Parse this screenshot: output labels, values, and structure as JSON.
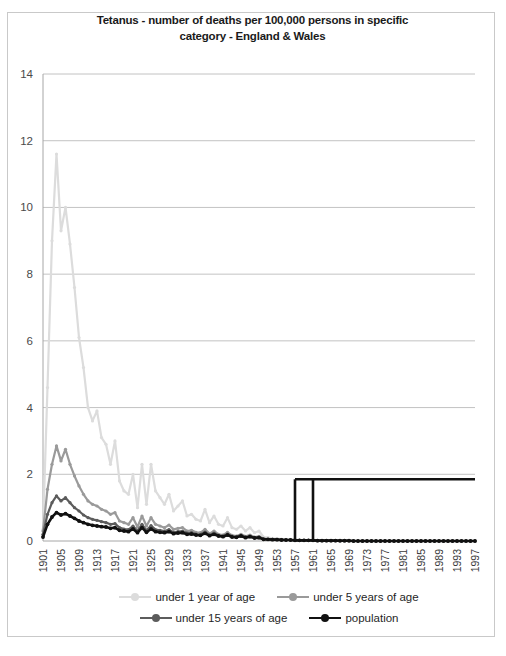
{
  "chart_data": {
    "type": "line",
    "title": "Tetanus - number of deaths per 100,000  persons in specific category - England & Wales",
    "title_line1": "Tetanus - number of deaths per 100,000  persons in specific",
    "title_line2": "category - England & Wales",
    "xlabel": "",
    "ylabel": "",
    "ylim": [
      0,
      14
    ],
    "yticks": [
      0,
      2,
      4,
      6,
      8,
      10,
      12,
      14
    ],
    "grid": true,
    "legend_position": "bottom",
    "x_start": 1901,
    "x_end": 1997,
    "xtick_step": 4,
    "xticks": [
      1901,
      1905,
      1909,
      1913,
      1917,
      1921,
      1925,
      1929,
      1933,
      1937,
      1941,
      1945,
      1949,
      1953,
      1957,
      1961,
      1965,
      1969,
      1973,
      1977,
      1981,
      1985,
      1989,
      1993,
      1997
    ],
    "x": [
      1901,
      1902,
      1903,
      1904,
      1905,
      1906,
      1907,
      1908,
      1909,
      1910,
      1911,
      1912,
      1913,
      1914,
      1915,
      1916,
      1917,
      1918,
      1919,
      1920,
      1921,
      1922,
      1923,
      1924,
      1925,
      1926,
      1927,
      1928,
      1929,
      1930,
      1931,
      1932,
      1933,
      1934,
      1935,
      1936,
      1937,
      1938,
      1939,
      1940,
      1941,
      1942,
      1943,
      1944,
      1945,
      1946,
      1947,
      1948,
      1949,
      1950,
      1951,
      1952,
      1953,
      1954,
      1955,
      1956,
      1957,
      1958,
      1959,
      1960,
      1961,
      1962,
      1963,
      1964,
      1965,
      1966,
      1967,
      1968,
      1969,
      1970,
      1971,
      1972,
      1973,
      1974,
      1975,
      1976,
      1977,
      1978,
      1979,
      1980,
      1981,
      1982,
      1983,
      1984,
      1985,
      1986,
      1987,
      1988,
      1989,
      1990,
      1991,
      1992,
      1993,
      1994,
      1995,
      1996,
      1997
    ],
    "series": [
      {
        "name": "under 1 year of age",
        "color": "#dcdcdc",
        "values": [
          0.35,
          4.6,
          9.0,
          11.6,
          9.3,
          10.0,
          8.9,
          7.6,
          6.1,
          5.2,
          4.0,
          3.6,
          3.9,
          3.1,
          2.9,
          2.3,
          3.0,
          1.8,
          1.5,
          1.4,
          2.0,
          1.0,
          2.3,
          1.1,
          2.3,
          1.5,
          1.3,
          1.1,
          1.4,
          0.9,
          1.05,
          1.2,
          0.75,
          0.8,
          0.65,
          0.6,
          0.95,
          0.55,
          0.75,
          0.5,
          0.45,
          0.7,
          0.4,
          0.35,
          0.45,
          0.3,
          0.4,
          0.25,
          0.3,
          0.12,
          0.1,
          0.08,
          0.07,
          0.06,
          0.05,
          0.05,
          0.04,
          0.03,
          0.03,
          0.02,
          0.02,
          0.02,
          0.01,
          0.01,
          0.01,
          0.01,
          0.0,
          0.0,
          0.0,
          0.0,
          0.0,
          0.0,
          0.0,
          0.0,
          0.0,
          0.0,
          0.0,
          0.0,
          0.0,
          0.0,
          0.0,
          0.0,
          0.0,
          0.0,
          0.0,
          0.0,
          0.0,
          0.0,
          0.0,
          0.0,
          0.0,
          0.0,
          0.0,
          0.0,
          0.0,
          0.0,
          0.0
        ]
      },
      {
        "name": "under 5 years of age",
        "color": "#9a9a9a",
        "values": [
          0.3,
          1.55,
          2.3,
          2.85,
          2.4,
          2.75,
          2.3,
          1.95,
          1.65,
          1.4,
          1.2,
          1.1,
          1.05,
          0.95,
          0.9,
          0.8,
          0.85,
          0.6,
          0.55,
          0.5,
          0.7,
          0.42,
          0.75,
          0.45,
          0.7,
          0.5,
          0.45,
          0.4,
          0.48,
          0.35,
          0.38,
          0.4,
          0.3,
          0.32,
          0.26,
          0.25,
          0.35,
          0.22,
          0.3,
          0.2,
          0.18,
          0.26,
          0.17,
          0.15,
          0.2,
          0.14,
          0.18,
          0.12,
          0.14,
          0.07,
          0.06,
          0.05,
          0.05,
          0.04,
          0.03,
          0.03,
          0.03,
          0.02,
          0.02,
          0.02,
          0.02,
          0.01,
          0.01,
          0.01,
          0.01,
          0.01,
          0.0,
          0.0,
          0.0,
          0.0,
          0.0,
          0.0,
          0.0,
          0.0,
          0.0,
          0.0,
          0.0,
          0.0,
          0.0,
          0.0,
          0.0,
          0.0,
          0.0,
          0.0,
          0.0,
          0.0,
          0.0,
          0.0,
          0.0,
          0.0,
          0.0,
          0.0,
          0.0,
          0.0,
          0.0,
          0.0,
          0.0
        ]
      },
      {
        "name": "under 15 years of age",
        "color": "#5c5c5c",
        "values": [
          0.2,
          0.8,
          1.15,
          1.35,
          1.2,
          1.3,
          1.15,
          1.0,
          0.9,
          0.78,
          0.7,
          0.65,
          0.62,
          0.58,
          0.55,
          0.5,
          0.52,
          0.4,
          0.36,
          0.34,
          0.45,
          0.3,
          0.5,
          0.32,
          0.46,
          0.34,
          0.32,
          0.3,
          0.34,
          0.26,
          0.28,
          0.3,
          0.24,
          0.25,
          0.21,
          0.2,
          0.27,
          0.18,
          0.24,
          0.17,
          0.15,
          0.21,
          0.14,
          0.13,
          0.17,
          0.12,
          0.15,
          0.1,
          0.12,
          0.06,
          0.05,
          0.05,
          0.04,
          0.04,
          0.03,
          0.03,
          0.02,
          0.02,
          0.02,
          0.02,
          0.02,
          0.01,
          0.01,
          0.01,
          0.01,
          0.01,
          0.0,
          0.0,
          0.0,
          0.0,
          0.0,
          0.0,
          0.0,
          0.0,
          0.0,
          0.0,
          0.0,
          0.0,
          0.0,
          0.0,
          0.0,
          0.0,
          0.0,
          0.0,
          0.0,
          0.0,
          0.0,
          0.0,
          0.0,
          0.0,
          0.0,
          0.0,
          0.0,
          0.0,
          0.0,
          0.0,
          0.0
        ]
      },
      {
        "name": "population",
        "color": "#111111",
        "values": [
          0.12,
          0.5,
          0.72,
          0.85,
          0.78,
          0.82,
          0.75,
          0.68,
          0.6,
          0.55,
          0.5,
          0.47,
          0.45,
          0.43,
          0.42,
          0.38,
          0.4,
          0.32,
          0.3,
          0.28,
          0.36,
          0.25,
          0.4,
          0.26,
          0.36,
          0.28,
          0.26,
          0.25,
          0.28,
          0.22,
          0.24,
          0.25,
          0.2,
          0.21,
          0.18,
          0.17,
          0.23,
          0.16,
          0.2,
          0.15,
          0.13,
          0.18,
          0.12,
          0.11,
          0.15,
          0.1,
          0.13,
          0.09,
          0.1,
          0.05,
          0.05,
          0.04,
          0.04,
          0.03,
          0.03,
          0.03,
          0.02,
          0.02,
          0.02,
          0.02,
          0.02,
          0.01,
          0.01,
          0.01,
          0.01,
          0.01,
          0.01,
          0.01,
          0.01,
          0.0,
          0.0,
          0.0,
          0.0,
          0.0,
          0.0,
          0.0,
          0.0,
          0.0,
          0.0,
          0.0,
          0.0,
          0.0,
          0.0,
          0.0,
          0.0,
          0.0,
          0.0,
          0.0,
          0.0,
          0.0,
          0.0,
          0.0,
          0.0,
          0.0,
          0.0,
          0.0,
          0.0
        ]
      }
    ],
    "annotation_overlay": {
      "description": "black rectangle artifact spanning 1957-1997 at value 1.85",
      "value": 1.85,
      "x_from": 1957,
      "x_to": 1997,
      "inner_vertical": 1961,
      "color": "#111111"
    }
  },
  "legend": {
    "items": [
      {
        "label": "under 1 year of age"
      },
      {
        "label": "under 5 years of age"
      },
      {
        "label": "under 15 years of age"
      },
      {
        "label": "population"
      }
    ]
  }
}
